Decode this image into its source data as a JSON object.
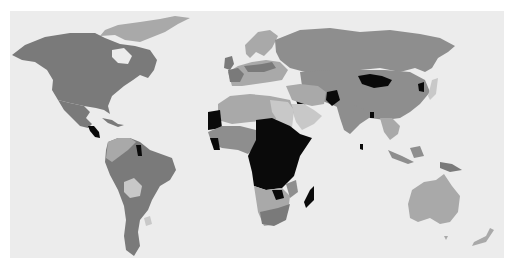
{
  "map": {
    "type": "choropleth-world",
    "legend": null,
    "title": null,
    "colors": {
      "background": "#ffffff",
      "ocean": "#ececec",
      "level_1_lightest": "#c8c8c8",
      "level_2": "#a9a9a9",
      "level_3": "#8e8e8e",
      "level_4": "#7a7a7a",
      "level_5_darkest": "#0a0a0a"
    },
    "regions": [
      {
        "name": "North America (Canada, USA)",
        "shade": "level_4"
      },
      {
        "name": "Greenland",
        "shade": "level_2"
      },
      {
        "name": "Mexico",
        "shade": "level_4"
      },
      {
        "name": "Central America (Guatemala/Honduras)",
        "shade": "level_5_darkest"
      },
      {
        "name": "Caribbean",
        "shade": "level_4"
      },
      {
        "name": "South America (Brazil, Argentina, Peru)",
        "shade": "level_4"
      },
      {
        "name": "Bolivia",
        "shade": "level_1_lightest"
      },
      {
        "name": "Colombia/Venezuela",
        "shade": "level_2"
      },
      {
        "name": "Suriname/Guyana",
        "shade": "level_5_darkest"
      },
      {
        "name": "Europe (UK, France)",
        "shade": "level_4"
      },
      {
        "name": "Scandinavia",
        "shade": "level_2"
      },
      {
        "name": "Russia",
        "shade": "level_3"
      },
      {
        "name": "Central Asia / China",
        "shade": "level_3"
      },
      {
        "name": "Mongolia",
        "shade": "level_5_darkest"
      },
      {
        "name": "Afghanistan",
        "shade": "level_5_darkest"
      },
      {
        "name": "Iraq",
        "shade": "level_5_darkest"
      },
      {
        "name": "North Korea",
        "shade": "level_5_darkest"
      },
      {
        "name": "Bangladesh",
        "shade": "level_5_darkest"
      },
      {
        "name": "Sri Lanka",
        "shade": "level_5_darkest"
      },
      {
        "name": "India",
        "shade": "level_3"
      },
      {
        "name": "Arabian Peninsula",
        "shade": "level_1_lightest"
      },
      {
        "name": "North Africa",
        "shade": "level_2"
      },
      {
        "name": "Mauritania",
        "shade": "level_5_darkest"
      },
      {
        "name": "West Africa (Sierra Leone/Liberia)",
        "shade": "level_5_darkest"
      },
      {
        "name": "Central & East Africa",
        "shade": "level_5_darkest"
      },
      {
        "name": "Madagascar",
        "shade": "level_5_darkest"
      },
      {
        "name": "Zimbabwe",
        "shade": "level_5_darkest"
      },
      {
        "name": "South Africa",
        "shade": "level_4"
      },
      {
        "name": "Namibia/Botswana",
        "shade": "level_1_lightest"
      },
      {
        "name": "Southeast Asia / Indonesia",
        "shade": "level_3"
      },
      {
        "name": "Papua New Guinea",
        "shade": "level_4"
      },
      {
        "name": "Australia",
        "shade": "level_2"
      },
      {
        "name": "New Zealand",
        "shade": "level_2"
      }
    ]
  }
}
